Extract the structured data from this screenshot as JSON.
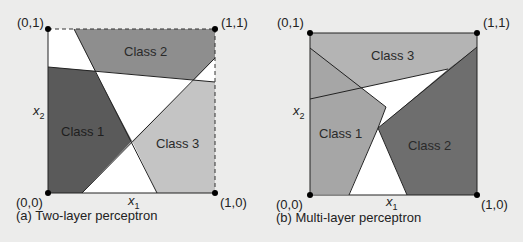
{
  "panels": [
    {
      "id": "a",
      "caption": "(a)  Two-layer perceptron",
      "classes": [
        "Class 1",
        "Class 2",
        "Class 3"
      ],
      "corners": {
        "top_left": "(0,1)",
        "top_right": "(1,1)",
        "bottom_left": "(0,0)",
        "bottom_right": "(1,0)"
      },
      "x_axis": "x",
      "x_axis_sub": "1",
      "y_axis": "x",
      "y_axis_sub": "2"
    },
    {
      "id": "b",
      "caption": "(b)  Multi-layer perceptron",
      "classes": [
        "Class 1",
        "Class 2",
        "Class 3"
      ],
      "corners": {
        "top_left": "(0,1)",
        "top_right": "(1,1)",
        "bottom_left": "(0,0)",
        "bottom_right": "(1,0)"
      },
      "x_axis": "x",
      "x_axis_sub": "1",
      "y_axis": "x",
      "y_axis_sub": "2"
    }
  ],
  "colors": {
    "background": "#ececeb",
    "class_dark": "#5a5a5a",
    "class_mid": "#8e8e8e",
    "class_light": "#c4c4c4",
    "class_b3": "#b4b4b4",
    "class_b1": "#a6a6a6",
    "class_b2": "#6e6e6e",
    "white": "#ffffff"
  }
}
